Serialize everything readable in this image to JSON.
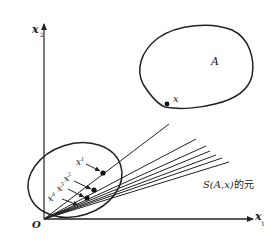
{
  "diagram": {
    "axes": {
      "x_axis_label": "x",
      "x_axis_sub": "1",
      "y_axis_label": "x",
      "y_axis_sub": "2",
      "origin_label": "O"
    },
    "set_label": "A",
    "boundary_point_label": "x",
    "sequence_points": [
      {
        "label": "x",
        "sup": "1"
      },
      {
        "label": "x",
        "sup": "2"
      },
      {
        "label": "x",
        "sup": "3"
      },
      {
        "label": "x",
        "sup": "4"
      }
    ],
    "rays_caption_main": "S(A,x)",
    "rays_caption_suffix": "的元",
    "colors": {
      "ink": "#222222",
      "background": "#ffffff"
    }
  }
}
